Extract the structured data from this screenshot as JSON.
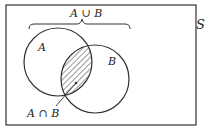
{
  "diagram": {
    "type": "venn",
    "universe_label": "S",
    "sets": [
      {
        "id": "A",
        "label": "A"
      },
      {
        "id": "B",
        "label": "B"
      }
    ],
    "union_label": "A ∪ B",
    "intersection_label": "A ∩ B",
    "colors": {
      "stroke": "#333333",
      "background": "#ffffff"
    }
  }
}
